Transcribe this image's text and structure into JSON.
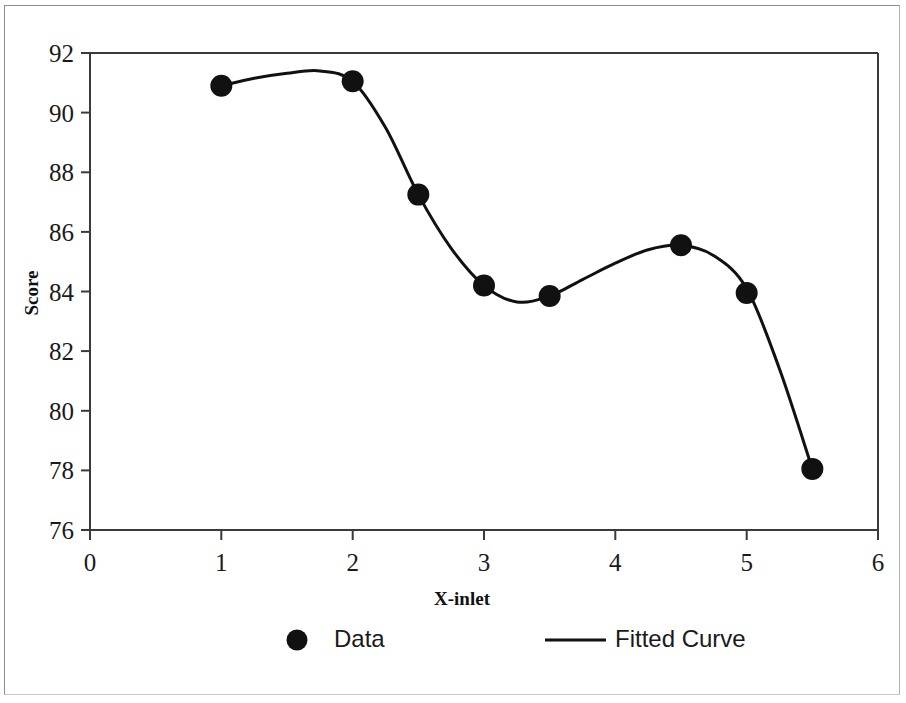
{
  "chart_data": {
    "type": "scatter",
    "title": "",
    "xlabel": "X-inlet",
    "ylabel": "Score",
    "xlim": [
      0,
      6
    ],
    "ylim": [
      76,
      92
    ],
    "xticks": [
      "0",
      "1",
      "2",
      "3",
      "4",
      "5",
      "6"
    ],
    "yticks": [
      "76",
      "78",
      "80",
      "82",
      "84",
      "86",
      "88",
      "90",
      "92"
    ],
    "xtick_values": [
      0,
      1,
      2,
      3,
      4,
      5,
      6
    ],
    "ytick_values": [
      76,
      78,
      80,
      82,
      84,
      86,
      88,
      90,
      92
    ],
    "grid": false,
    "legend_position": "below-axes",
    "series": [
      {
        "name": "Data",
        "type": "scatter",
        "marker": "filled-circle",
        "color": "#111111",
        "x": [
          1,
          2,
          2.5,
          3,
          3.5,
          4.5,
          5,
          5.5
        ],
        "y": [
          90.9,
          91.05,
          87.25,
          84.2,
          83.85,
          85.55,
          83.95,
          78.05
        ],
        "points": [
          {
            "x": 1,
            "y": 90.9
          },
          {
            "x": 2,
            "y": 91.05
          },
          {
            "x": 2.5,
            "y": 87.25
          },
          {
            "x": 3,
            "y": 84.2
          },
          {
            "x": 3.5,
            "y": 83.85
          },
          {
            "x": 4.5,
            "y": 85.55
          },
          {
            "x": 5,
            "y": 83.95
          },
          {
            "x": 5.5,
            "y": 78.05
          }
        ]
      },
      {
        "name": "Fitted Curve",
        "type": "line",
        "color": "#111111",
        "x": [
          1,
          1.25,
          1.5,
          1.75,
          2,
          2.25,
          2.5,
          2.75,
          3,
          3.25,
          3.5,
          3.75,
          4,
          4.25,
          4.5,
          4.75,
          5,
          5.25,
          5.5
        ],
        "y": [
          90.9,
          91.15,
          91.32,
          91.4,
          91.05,
          89.5,
          87.25,
          85.45,
          84.2,
          83.65,
          83.85,
          84.4,
          84.95,
          85.4,
          85.55,
          85.2,
          84.1,
          81.4,
          78.05
        ]
      }
    ],
    "legend": [
      {
        "label": "Data",
        "marker": "filled-circle"
      },
      {
        "label": "Fitted Curve",
        "marker": "line"
      }
    ]
  }
}
